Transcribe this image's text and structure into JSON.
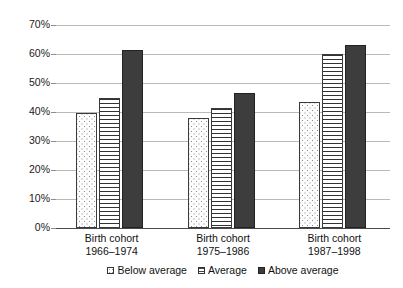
{
  "chart_data": {
    "type": "bar",
    "title": "",
    "subtitle": "",
    "xlabel": "",
    "ylabel": "",
    "categories": [
      "Birth cohort 1966–1974",
      "Birth cohort 1975–1986",
      "Birth cohort 1987–1998"
    ],
    "category_lines": [
      [
        "Birth cohort",
        "1966–1974"
      ],
      [
        "Birth cohort",
        "1975–1986"
      ],
      [
        "Birth cohort",
        "1987–1998"
      ]
    ],
    "series": [
      {
        "name": "Below average",
        "values": [
          39.5,
          38,
          43.5
        ],
        "pattern": "dotted",
        "color": "#fdfdfd"
      },
      {
        "name": "Average",
        "values": [
          45,
          41.5,
          60
        ],
        "pattern": "horizontal-stripes",
        "color": "#ffffff"
      },
      {
        "name": "Above average",
        "values": [
          61.5,
          46.5,
          63
        ],
        "pattern": "solid",
        "color": "#3d3d3d"
      }
    ],
    "ylim": [
      0,
      70
    ],
    "ytick_values": [
      0,
      10,
      20,
      30,
      40,
      50,
      60,
      70
    ],
    "ytick_labels": [
      "0%",
      "10%",
      "20%",
      "30%",
      "40%",
      "50%",
      "60%",
      "70%"
    ],
    "grid": true,
    "grid_axis": "y",
    "grid_color": "#b9b9b9",
    "axis_color": "#4a4a4a",
    "legend_position": "bottom",
    "legend_entries": [
      "Below average",
      "Average",
      "Above average"
    ],
    "value_labels_shown": false
  }
}
